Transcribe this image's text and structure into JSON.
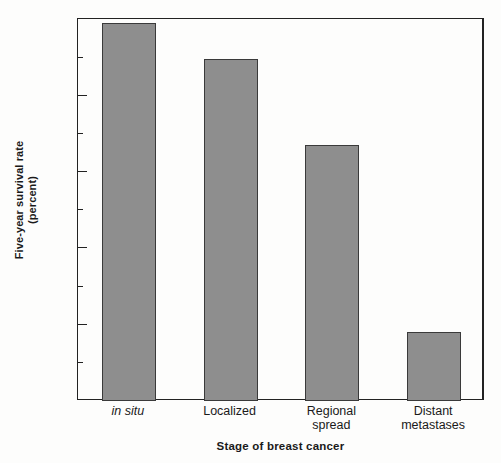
{
  "chart_data": {
    "type": "bar",
    "title": "",
    "xlabel": "Stage of breast cancer",
    "ylabel": "Five-year survival rate (percent)",
    "ylabel_line1": "Five-year survival rate",
    "ylabel_line2": "(percent)",
    "categories": [
      "in situ",
      "Localized",
      "Regional spread",
      "Distant metastases"
    ],
    "values": [
      99,
      89.5,
      67,
      18
    ],
    "ylim": [
      0,
      100
    ],
    "yticks": [
      0,
      20,
      40,
      60,
      80,
      100
    ],
    "ytick_labels": [
      "0",
      "20",
      "40",
      "60",
      "80",
      "100"
    ],
    "yticks_minor": [
      10,
      30,
      50,
      70,
      90
    ],
    "grid": false,
    "legend": false,
    "bar_color": "#8e8e8e",
    "bar_edge_color": "#3a3a3a",
    "axis_color": "#222222",
    "background_color": "#fdfdfc"
  },
  "bars": [
    {
      "label_line1": "in situ",
      "label_line2": "",
      "value": 99,
      "italic": true
    },
    {
      "label_line1": "Localized",
      "label_line2": "",
      "value": 89.5,
      "italic": false
    },
    {
      "label_line1": "Regional",
      "label_line2": "spread",
      "value": 67,
      "italic": false
    },
    {
      "label_line1": "Distant",
      "label_line2": "metastases",
      "value": 18,
      "italic": false
    }
  ],
  "y_axis": {
    "ticks": [
      {
        "label": "100",
        "value": 100
      },
      {
        "label": "80",
        "value": 80
      },
      {
        "label": "60",
        "value": 60
      },
      {
        "label": "40",
        "value": 40
      },
      {
        "label": "20",
        "value": 20
      },
      {
        "label": "0",
        "value": 0
      }
    ],
    "minor_ticks": [
      90,
      70,
      50,
      30,
      10
    ]
  }
}
